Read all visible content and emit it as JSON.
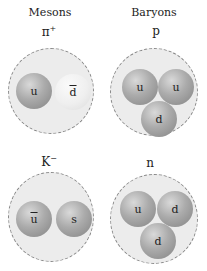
{
  "headers": {
    "left": "Mesons",
    "right": "Baryons"
  },
  "particles": [
    {
      "name": "pi-plus",
      "symbol": "π",
      "sup": "+",
      "quarks": [
        "u",
        "d̄"
      ]
    },
    {
      "name": "proton",
      "symbol": "p",
      "sup": "",
      "quarks": [
        "u",
        "u",
        "d"
      ]
    },
    {
      "name": "k-minus",
      "symbol": "K",
      "sup": "−",
      "quarks": [
        "ū",
        "s"
      ]
    },
    {
      "name": "neutron",
      "symbol": "n",
      "sup": "",
      "quarks": [
        "u",
        "d",
        "d"
      ]
    }
  ],
  "q": {
    "pi_u": "u",
    "pi_d": "d",
    "p_u1": "u",
    "p_u2": "u",
    "p_d": "d",
    "k_u": "u",
    "k_s": "s",
    "n_u": "u",
    "n_d1": "d",
    "n_d2": "d"
  },
  "sym": {
    "pi": "π",
    "pi_sup": "+",
    "p": "p",
    "k": "K",
    "k_sup": "−",
    "n": "n"
  }
}
